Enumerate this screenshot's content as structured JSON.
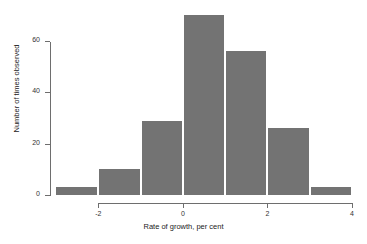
{
  "chart_data": {
    "type": "bar",
    "title": "",
    "subtitle": "",
    "xlabel": "Rate of growth, per cent",
    "ylabel": "Number of times observed",
    "grid": false,
    "legend": null,
    "bin_width": 1,
    "bin_edges": [
      -3,
      -2,
      -1,
      0,
      1,
      2,
      3,
      4
    ],
    "categories": [
      "-3 to -2",
      "-2 to -1",
      "-1 to 0",
      "0 to 1",
      "1 to 2",
      "2 to 3",
      "3 to 4"
    ],
    "values": [
      3,
      10,
      29,
      70,
      56,
      26,
      3
    ],
    "xlim": [
      -3,
      4
    ],
    "ylim": [
      0,
      72
    ],
    "xticks": [
      -2,
      0,
      2,
      4
    ],
    "xtick_labels": [
      "-2",
      "0",
      "2",
      "4"
    ],
    "yticks": [
      0,
      20,
      40,
      60
    ],
    "ytick_labels": [
      "0",
      "20",
      "40",
      "60"
    ],
    "bar_color": "#737373",
    "axis_color": "#6e6e6e",
    "background": "#ffffff"
  },
  "axes": {
    "y_title": "Number of times observed",
    "x_title": "Rate of growth, per cent",
    "y_ticks": [
      {
        "label": "0",
        "value": 0
      },
      {
        "label": "20",
        "value": 20
      },
      {
        "label": "40",
        "value": 40
      },
      {
        "label": "60",
        "value": 60
      }
    ],
    "x_ticks": [
      {
        "label": "-2",
        "value": -2
      },
      {
        "label": "0",
        "value": 0
      },
      {
        "label": "2",
        "value": 2
      },
      {
        "label": "4",
        "value": 4
      }
    ]
  }
}
